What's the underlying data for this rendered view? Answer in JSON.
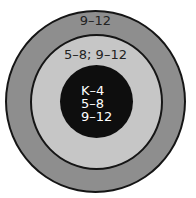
{
  "diagram": {
    "type": "concentric-circles",
    "colors": {
      "background": "#ffffff",
      "outer_ring": "#8e8e8e",
      "middle_ring": "#c6c6c6",
      "inner_circle": "#0e0e0e",
      "outline": "#151515",
      "dark_text": "#222222",
      "light_text": "#ffffff"
    },
    "rings": [
      {
        "id": "outer",
        "label": "9–12"
      },
      {
        "id": "middle",
        "label": "5–8; 9–12"
      },
      {
        "id": "inner",
        "lines": [
          "K–4",
          "5–8",
          "9–12"
        ]
      }
    ]
  }
}
